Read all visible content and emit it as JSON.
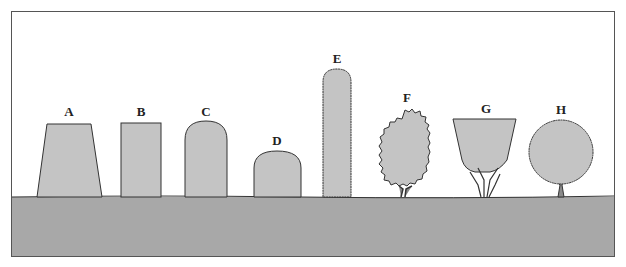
{
  "diagram": {
    "type": "hedge-shapes-profile",
    "colors": {
      "ground": "#a8a8a8",
      "shrub_fill": "#c4c4c4",
      "outline": "#333333",
      "background": "#ffffff"
    },
    "shapes": [
      {
        "label": "A",
        "form": "tapered trapezoid (wide base)"
      },
      {
        "label": "B",
        "form": "rectangle"
      },
      {
        "label": "C",
        "form": "rounded-top tall"
      },
      {
        "label": "D",
        "form": "rounded-top short"
      },
      {
        "label": "E",
        "form": "tall narrow rounded column"
      },
      {
        "label": "F",
        "form": "informal bushy oval"
      },
      {
        "label": "G",
        "form": "inverted trapezoid (narrow base, exposed stems)"
      },
      {
        "label": "H",
        "form": "round ball on short trunk"
      }
    ]
  }
}
